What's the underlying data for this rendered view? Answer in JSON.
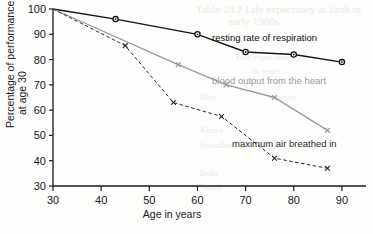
{
  "chart_data": {
    "type": "line",
    "title": "",
    "subtitle": "",
    "xlabel": "Age in years",
    "ylabel": "Percentage of performance at age 30",
    "ylabel_line1": "Percentage of performance",
    "ylabel_line2": "at age 30",
    "xlim": [
      30,
      95
    ],
    "ylim": [
      30,
      100
    ],
    "xticks": [
      30,
      40,
      50,
      60,
      70,
      80,
      90
    ],
    "yticks": [
      30,
      40,
      50,
      60,
      70,
      80,
      90,
      100
    ],
    "xtick_labels": [
      "30",
      "40",
      "50",
      "60",
      "70",
      "80",
      "90"
    ],
    "ytick_labels": [
      "30",
      "40",
      "50",
      "60",
      "70",
      "80",
      "90",
      "100"
    ],
    "grid": false,
    "legend_position": "inline-annotations",
    "series": [
      {
        "name": "resting rate of respiration",
        "color": "#121212",
        "style": "solid",
        "marker": "circle",
        "x": [
          30,
          43,
          60,
          70,
          80,
          90
        ],
        "values": [
          100,
          96,
          90,
          83,
          82,
          79
        ]
      },
      {
        "name": "blood output from the heart",
        "color": "#9a9a9a",
        "style": "solid",
        "marker": "x",
        "x": [
          30,
          56,
          66,
          76,
          87
        ],
        "values": [
          100,
          78,
          70,
          65,
          52
        ]
      },
      {
        "name": "maximum air breathed in",
        "color": "#2a2a2a",
        "style": "dashed",
        "marker": "x",
        "x": [
          30,
          45,
          55,
          65,
          76,
          87
        ],
        "values": [
          100,
          85.5,
          63,
          57.5,
          41,
          37
        ]
      }
    ],
    "annotations": [
      {
        "text": "resting rate of respiration",
        "color": "#121212",
        "x_px": 212,
        "y_px": 41
      },
      {
        "text": "blood output from the heart",
        "color": "#9a9a9a",
        "x_px": 212,
        "y_px": 84
      },
      {
        "text": "maximum air breathed in",
        "color": "#2a2a2a",
        "x_px": 232,
        "y_px": 147
      }
    ]
  },
  "background_bleed": [
    {
      "text": "Table 24.2 Life expectancy at birth in",
      "x_px": 196,
      "y_px": 3,
      "size_px": 11
    },
    {
      "text": "early 1980s",
      "x_px": 228,
      "y_px": 15,
      "size_px": 11
    },
    {
      "text": "Life expectancy",
      "x_px": 236,
      "y_px": 52,
      "size_px": 9
    },
    {
      "text": "in years",
      "x_px": 252,
      "y_px": 66,
      "size_px": 9
    },
    {
      "text": "Men",
      "x_px": 200,
      "y_px": 92,
      "size_px": 9
    },
    {
      "text": "Women",
      "x_px": 268,
      "y_px": 92,
      "size_px": 9
    },
    {
      "text": "Kenya",
      "x_px": 200,
      "y_px": 125,
      "size_px": 9
    },
    {
      "text": "Swaziland",
      "x_px": 200,
      "y_px": 140,
      "size_px": 9
    },
    {
      "text": "India",
      "x_px": 200,
      "y_px": 168,
      "size_px": 9
    },
    {
      "text": "Brazil",
      "x_px": 200,
      "y_px": 182,
      "size_px": 9
    }
  ]
}
